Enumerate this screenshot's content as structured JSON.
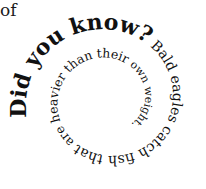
{
  "stray_text": "of",
  "spiral": {
    "segments": [
      {
        "text": "Did you know?",
        "size": 22,
        "weight": "bold"
      },
      {
        "text": " Bald eagles catch fish that",
        "size": 14,
        "weight": "normal"
      },
      {
        "text": " are heavier than their",
        "size": 12.5,
        "weight": "normal"
      },
      {
        "text": " own weight.",
        "size": 11,
        "weight": "normal"
      }
    ]
  },
  "colors": {
    "text": "#111111",
    "background": "#ffffff"
  }
}
